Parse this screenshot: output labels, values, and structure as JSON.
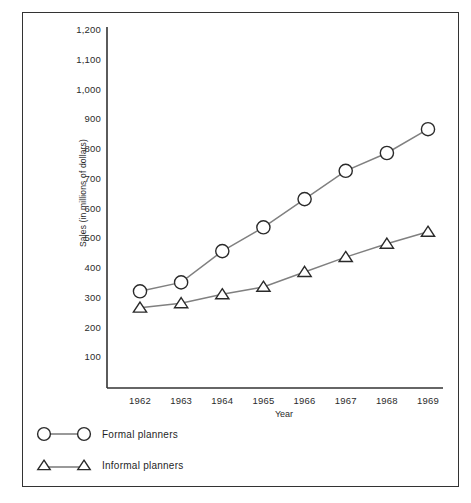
{
  "chart_data": {
    "type": "line",
    "title": "",
    "xlabel": "Year",
    "ylabel": "Sales (in millions of dollars)",
    "categories": [
      "1962",
      "1963",
      "1964",
      "1965",
      "1966",
      "1967",
      "1968",
      "1969"
    ],
    "x": [
      1962,
      1963,
      1964,
      1965,
      1966,
      1967,
      1968,
      1969
    ],
    "xlim": [
      1961.5,
      1969.5
    ],
    "ylim": [
      0,
      1200
    ],
    "yticks": [
      "100",
      "200",
      "300",
      "400",
      "500",
      "600",
      "700",
      "800",
      "900",
      "1,000",
      "1,100",
      "1,200"
    ],
    "ytick_values": [
      100,
      200,
      300,
      400,
      500,
      600,
      700,
      800,
      900,
      1000,
      1100,
      1200
    ],
    "grid": false,
    "legend_position": "below-plot-left",
    "series": [
      {
        "name": "Formal planners",
        "marker": "circle",
        "color": "#808080",
        "values": [
          325,
          355,
          460,
          540,
          635,
          730,
          790,
          870
        ]
      },
      {
        "name": "Informal planners",
        "marker": "triangle",
        "color": "#808080",
        "values": [
          270,
          285,
          315,
          340,
          390,
          440,
          485,
          525
        ]
      }
    ]
  },
  "legend": {
    "items": [
      {
        "label": "Formal planners",
        "marker": "circle"
      },
      {
        "label": "Informal planners",
        "marker": "triangle"
      }
    ]
  }
}
